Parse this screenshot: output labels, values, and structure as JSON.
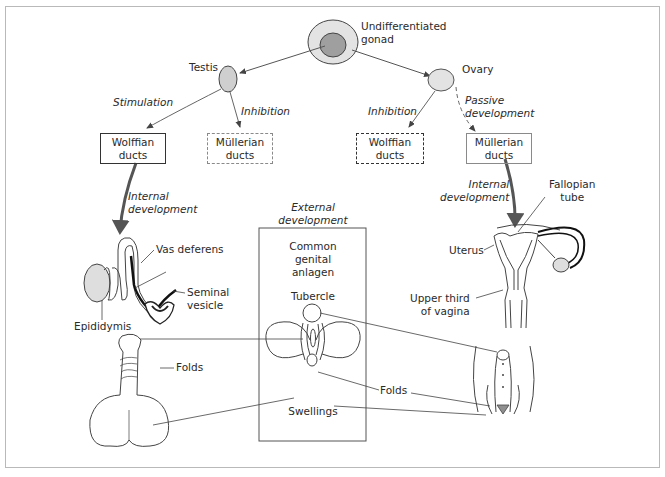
{
  "diagram": {
    "type": "sexual differentiation flow diagram",
    "root": {
      "label": "Undifferentiated\ngonad"
    },
    "branches": {
      "male": {
        "gonad": "Testis",
        "stimulation_label": "Stimulation",
        "inhibition_label": "Inhibition",
        "wolffian_box": "Wolffian\nducts",
        "mullerian_box": "Müllerian\nducts",
        "internal_label": "Internal\ndevelopment",
        "parts": [
          "Vas deferens",
          "Seminal\nvesicle",
          "Epididymis"
        ]
      },
      "female": {
        "gonad": "Ovary",
        "inhibition_label": "Inhibition",
        "passive_label": "Passive\ndevelopment",
        "wolffian_box": "Wolffian\nducts",
        "mullerian_box": "Müllerian\nducts",
        "internal_label": "Internal\ndevelopment",
        "parts": [
          "Fallopian\ntube",
          "Uterus",
          "Upper third\nof vagina"
        ]
      }
    },
    "external": {
      "heading": "External\ndevelopment",
      "box_title": "Common\ngenital\nanlagen",
      "tubercle": "Tubercle",
      "folds": "Folds",
      "swellings": "Swellings",
      "male_folds": "Folds"
    },
    "colors": {
      "line": "#333333",
      "gonad_fill": "#d9d9d9",
      "gonad_inner_fill": "#9a9a9a",
      "frame": "#b9b9b9",
      "arrow_thick": "#555555"
    }
  }
}
